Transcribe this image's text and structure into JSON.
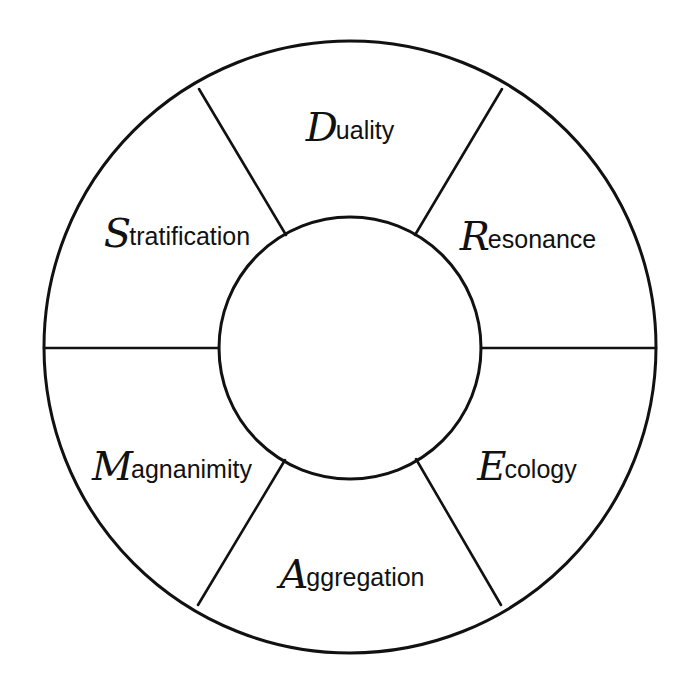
{
  "diagram": {
    "type": "segmented-ring",
    "colors": {
      "line": "#111111",
      "background": "#ffffff",
      "text": "#111111"
    },
    "outer_circle": {
      "cx": 350,
      "cy": 347,
      "r": 306
    },
    "inner_circle": {
      "cx": 350,
      "cy": 348,
      "r": 131
    },
    "segment_count": 6,
    "center_label": "",
    "segments": [
      {
        "id": "duality",
        "initial": "D",
        "rest": "uality",
        "word": "Duality",
        "position": "top"
      },
      {
        "id": "resonance",
        "initial": "R",
        "rest": "esonance",
        "word": "Resonance",
        "position": "upper-right"
      },
      {
        "id": "ecology",
        "initial": "E",
        "rest": "cology",
        "word": "Ecology",
        "position": "lower-right"
      },
      {
        "id": "aggregation",
        "initial": "A",
        "rest": "ggregation",
        "word": "Aggregation",
        "position": "bottom"
      },
      {
        "id": "magnanimity",
        "initial": "M",
        "rest": "agnanimity",
        "word": "Magnanimity",
        "position": "lower-left"
      },
      {
        "id": "stratification",
        "initial": "S",
        "rest": "tratification",
        "word": "Stratification",
        "position": "upper-left"
      }
    ]
  }
}
